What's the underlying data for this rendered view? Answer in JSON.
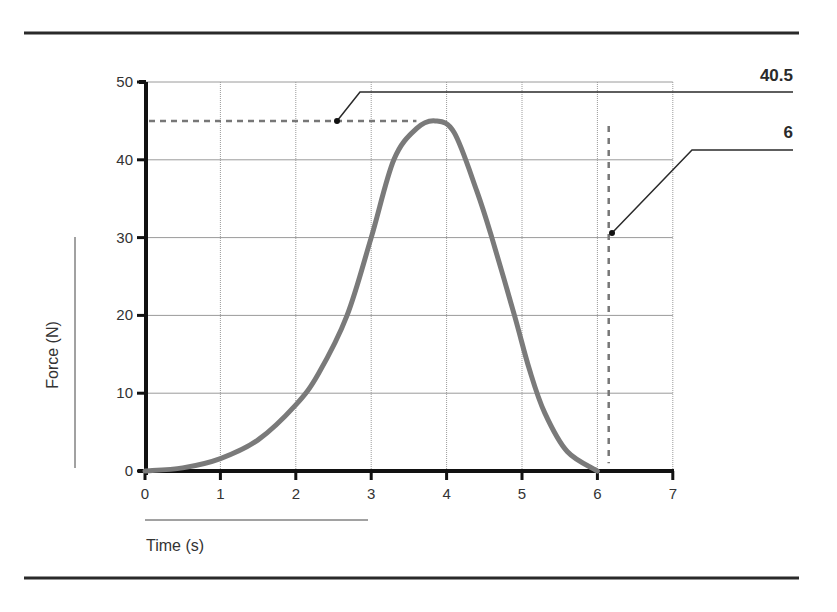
{
  "chart_data": {
    "type": "line",
    "title": "",
    "xlabel": "Time (s)",
    "ylabel": "Force (N)",
    "xlim": [
      0,
      7
    ],
    "ylim": [
      0,
      50
    ],
    "xticks": [
      0,
      1,
      2,
      3,
      4,
      5,
      6,
      7
    ],
    "yticks": [
      0,
      10,
      20,
      30,
      40,
      50
    ],
    "grid": true,
    "legend": null,
    "series": [
      {
        "name": "Force",
        "color": "#7a7a7a",
        "x": [
          0,
          0.5,
          1,
          1.5,
          2,
          2.3,
          2.68,
          3.0,
          3.3,
          3.6,
          3.85,
          4.1,
          4.4,
          4.6,
          4.9,
          5.1,
          5.3,
          5.6,
          6.0
        ],
        "y": [
          0,
          0.4,
          1.6,
          4.0,
          8.5,
          12.5,
          20,
          30,
          40,
          44,
          45,
          43.5,
          36,
          30,
          20,
          13,
          7.5,
          2.5,
          0
        ]
      }
    ],
    "annotations": [
      {
        "type": "hline-dashed",
        "y": 45,
        "x_range": [
          0,
          3.6
        ],
        "label": "40.5"
      },
      {
        "type": "vline-dashed",
        "x": 6.15,
        "y_range": [
          1,
          45
        ],
        "label": "6"
      }
    ]
  },
  "labels": {
    "callout_peak": "40.5",
    "callout_time": "6",
    "xlabel": "Time (s)",
    "ylabel": "Force (N)",
    "xticks": [
      "0",
      "1",
      "2",
      "3",
      "4",
      "5",
      "6",
      "7"
    ],
    "yticks": [
      "0",
      "10",
      "20",
      "30",
      "40",
      "50"
    ]
  }
}
